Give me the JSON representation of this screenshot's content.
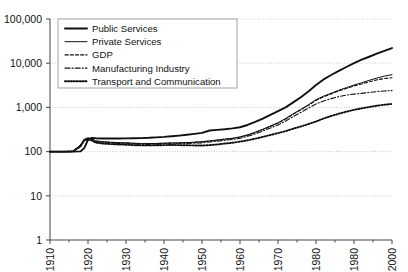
{
  "chart_data": {
    "type": "line",
    "title": "",
    "subtitle": "",
    "xlabel": "",
    "ylabel": "",
    "yscale": "log",
    "ylim": [
      1,
      100000
    ],
    "xlim": [
      1910,
      2000
    ],
    "grid": true,
    "legend_position": "top-left",
    "ytick_labels": [
      "100,000",
      "10,000",
      "1,000",
      "100",
      "10",
      "1"
    ],
    "ytick_values": [
      100000,
      10000,
      1000,
      100,
      10,
      1
    ],
    "xtick_labels": [
      "1910",
      "1920",
      "1930",
      "1940",
      "1950",
      "1960",
      "1970",
      "1980",
      "1980",
      "2000"
    ],
    "xtick_values": [
      1910,
      1920,
      1930,
      1940,
      1950,
      1960,
      1970,
      1980,
      1990,
      2000
    ],
    "x": [
      1910,
      1912,
      1914,
      1916,
      1918,
      1919,
      1920,
      1921,
      1922,
      1924,
      1926,
      1928,
      1930,
      1932,
      1934,
      1936,
      1938,
      1940,
      1942,
      1944,
      1946,
      1948,
      1950,
      1952,
      1954,
      1956,
      1958,
      1960,
      1962,
      1964,
      1966,
      1968,
      1970,
      1972,
      1974,
      1976,
      1978,
      1980,
      1982,
      1984,
      1986,
      1988,
      1990,
      1992,
      1994,
      1996,
      1998,
      2000
    ],
    "series": [
      {
        "name": "Public Services",
        "style": "solid-thick",
        "values": [
          100,
          100,
          100,
          100,
          101,
          120,
          185,
          205,
          200,
          198,
          198,
          198,
          199,
          200,
          202,
          205,
          210,
          215,
          222,
          230,
          240,
          252,
          265,
          300,
          310,
          320,
          335,
          355,
          400,
          470,
          560,
          680,
          820,
          1000,
          1300,
          1700,
          2300,
          3200,
          4300,
          5400,
          6700,
          8200,
          10000,
          12000,
          14000,
          16500,
          19000,
          22000
        ]
      },
      {
        "name": "Private Services",
        "style": "solid-thin",
        "values": [
          100,
          100,
          100,
          101,
          140,
          190,
          205,
          195,
          175,
          168,
          163,
          160,
          158,
          155,
          152,
          152,
          153,
          155,
          157,
          158,
          160,
          163,
          168,
          175,
          183,
          192,
          200,
          215,
          240,
          275,
          320,
          380,
          450,
          560,
          720,
          900,
          1150,
          1500,
          1800,
          2100,
          2450,
          2800,
          3200,
          3600,
          4100,
          4600,
          5100,
          5500
        ]
      },
      {
        "name": "GDP",
        "style": "dashed",
        "values": [
          100,
          100,
          100,
          101,
          138,
          188,
          200,
          190,
          172,
          165,
          161,
          158,
          156,
          153,
          151,
          151,
          152,
          154,
          156,
          157,
          159,
          162,
          166,
          173,
          181,
          190,
          198,
          212,
          236,
          270,
          315,
          372,
          440,
          545,
          700,
          875,
          1110,
          1440,
          1730,
          2020,
          2350,
          2690,
          3050,
          3400,
          3800,
          4200,
          4500,
          4700
        ]
      },
      {
        "name": "Manufacturing Industry",
        "style": "dash-dot",
        "values": [
          100,
          100,
          100,
          101,
          135,
          185,
          198,
          186,
          168,
          160,
          156,
          153,
          151,
          148,
          146,
          146,
          147,
          148,
          150,
          151,
          152,
          155,
          158,
          165,
          172,
          180,
          188,
          200,
          222,
          252,
          292,
          342,
          400,
          490,
          620,
          770,
          960,
          1200,
          1400,
          1580,
          1760,
          1900,
          2000,
          2080,
          2180,
          2280,
          2350,
          2400
        ]
      },
      {
        "name": "Transport and Communication",
        "style": "dotted",
        "values": [
          100,
          100,
          100,
          101,
          130,
          178,
          190,
          178,
          160,
          152,
          148,
          145,
          143,
          140,
          138,
          138,
          139,
          140,
          141,
          140,
          139,
          138,
          137,
          140,
          145,
          152,
          158,
          168,
          180,
          196,
          215,
          238,
          262,
          290,
          330,
          370,
          420,
          480,
          560,
          640,
          720,
          800,
          880,
          950,
          1020,
          1090,
          1150,
          1200
        ]
      }
    ]
  },
  "legend": {
    "items": [
      {
        "label": "Public Services",
        "style": "solid-thick"
      },
      {
        "label": "Private Services",
        "style": "solid-thin"
      },
      {
        "label": "GDP",
        "style": "dashed"
      },
      {
        "label": "Manufacturing Industry",
        "style": "dash-dot"
      },
      {
        "label": "Transport and Communication",
        "style": "dotted"
      }
    ]
  },
  "colors": {
    "line": "#111111",
    "grid": "#bdbdbd",
    "axis": "#555555",
    "background": "#ffffff"
  }
}
